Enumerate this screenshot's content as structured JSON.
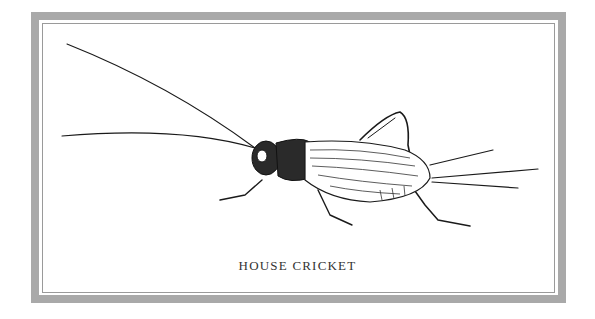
{
  "plate": {
    "caption": "HOUSE CRICKET",
    "frame_color": "#a9a9a9",
    "ink_color": "#1a1a1a",
    "subject_icon": "cricket-illustration"
  }
}
